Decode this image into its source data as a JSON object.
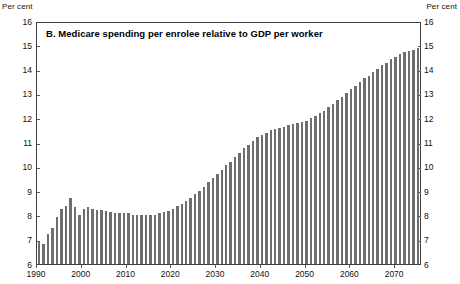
{
  "units": {
    "left_label": "Per cent",
    "right_label": "Per cent"
  },
  "chart_data": {
    "type": "bar",
    "title": "B. Medicare spending per enrolee relative to GDP per worker",
    "xlabel": "",
    "ylabel": "Per cent",
    "ylim": [
      6,
      16
    ],
    "xlim": [
      1990,
      2076
    ],
    "grid": false,
    "legend": null,
    "ytick_labels": [
      "16",
      "15",
      "14",
      "13",
      "12",
      "11",
      "10",
      "9",
      "8",
      "7",
      "6"
    ],
    "ytick_values": [
      16,
      15,
      14,
      13,
      12,
      11,
      10,
      9,
      8,
      7,
      6
    ],
    "xtick_labels": [
      "1990",
      "2000",
      "2010",
      "2020",
      "2030",
      "2040",
      "2050",
      "2060",
      "2070"
    ],
    "xtick_values": [
      1990,
      2000,
      2010,
      2020,
      2030,
      2040,
      2050,
      2060,
      2070
    ],
    "series_name": "Medicare spending per enrolee relative to GDP per worker",
    "bar_color": "#6e6e6e",
    "categories": [
      1990,
      1991,
      1992,
      1993,
      1994,
      1995,
      1996,
      1997,
      1998,
      1999,
      2000,
      2001,
      2002,
      2003,
      2004,
      2005,
      2006,
      2007,
      2008,
      2009,
      2010,
      2011,
      2012,
      2013,
      2014,
      2015,
      2016,
      2017,
      2018,
      2019,
      2020,
      2021,
      2022,
      2023,
      2024,
      2025,
      2026,
      2027,
      2028,
      2029,
      2030,
      2031,
      2032,
      2033,
      2034,
      2035,
      2036,
      2037,
      2038,
      2039,
      2040,
      2041,
      2042,
      2043,
      2044,
      2045,
      2046,
      2047,
      2048,
      2049,
      2050,
      2051,
      2052,
      2053,
      2054,
      2055,
      2056,
      2057,
      2058,
      2059,
      2060,
      2061,
      2062,
      2063,
      2064,
      2065,
      2066,
      2067,
      2068,
      2069,
      2070,
      2071,
      2072,
      2073,
      2074,
      2075
    ],
    "values": [
      6.95,
      6.85,
      7.25,
      7.5,
      7.95,
      8.3,
      8.4,
      8.75,
      8.35,
      8.05,
      8.3,
      8.35,
      8.3,
      8.25,
      8.25,
      8.2,
      8.15,
      8.1,
      8.1,
      8.1,
      8.1,
      8.05,
      8.05,
      8.05,
      8.05,
      8.05,
      8.05,
      8.1,
      8.15,
      8.2,
      8.3,
      8.4,
      8.5,
      8.6,
      8.75,
      8.9,
      9.05,
      9.2,
      9.4,
      9.55,
      9.75,
      9.9,
      10.1,
      10.25,
      10.45,
      10.6,
      10.8,
      10.95,
      11.1,
      11.25,
      11.35,
      11.45,
      11.55,
      11.6,
      11.65,
      11.7,
      11.75,
      11.8,
      11.85,
      11.9,
      11.95,
      12.05,
      12.15,
      12.25,
      12.35,
      12.5,
      12.65,
      12.8,
      12.95,
      13.1,
      13.25,
      13.4,
      13.55,
      13.7,
      13.8,
      13.95,
      14.1,
      14.25,
      14.35,
      14.5,
      14.6,
      14.7,
      14.8,
      14.85,
      14.9,
      14.95
    ]
  }
}
